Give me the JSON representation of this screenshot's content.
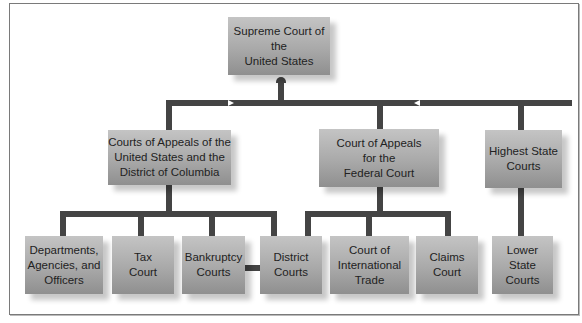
{
  "diagram": {
    "type": "org-chart",
    "nodes": {
      "supreme": "Supreme Court of the\nUnited States",
      "appeals_us_dc": "Courts of Appeals of the\nUnited States and the\nDistrict of Columbia",
      "appeals_federal": "Court of Appeals\nfor the\nFederal Court",
      "highest_state": "Highest State\nCourts",
      "departments": "Departments,\nAgencies, and\nOfficers",
      "tax": "Tax\nCourt",
      "bankruptcy": "Bankruptcy\nCourts",
      "district": "District\nCourts",
      "international_trade": "Court of\nInternational\nTrade",
      "claims": "Claims\nCourt",
      "lower_state": "Lower\nState\nCourts"
    },
    "edges": [
      [
        "appeals_us_dc",
        "supreme"
      ],
      [
        "appeals_federal",
        "supreme"
      ],
      [
        "highest_state",
        "supreme"
      ],
      [
        "departments",
        "appeals_us_dc"
      ],
      [
        "tax",
        "appeals_us_dc"
      ],
      [
        "bankruptcy",
        "appeals_us_dc"
      ],
      [
        "district",
        "appeals_us_dc"
      ],
      [
        "district",
        "appeals_federal"
      ],
      [
        "international_trade",
        "appeals_federal"
      ],
      [
        "claims",
        "appeals_federal"
      ],
      [
        "lower_state",
        "highest_state"
      ],
      [
        "bankruptcy",
        "district"
      ]
    ],
    "colors": {
      "box": "#a9a9a9",
      "connector": "#444444",
      "border": "#7a7a7a"
    }
  }
}
